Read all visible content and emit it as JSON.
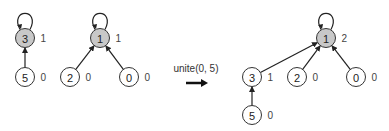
{
  "colors": {
    "root_fill": "#c8c8c8",
    "child_fill": "#ffffff",
    "stroke": "#333333"
  },
  "operation": {
    "label": "unite(0, 5)",
    "arrow_icon": "right-arrow-icon"
  },
  "before": {
    "nodes": [
      {
        "id": "3",
        "rank": "1",
        "root": true
      },
      {
        "id": "5",
        "rank": "0",
        "root": false
      },
      {
        "id": "1",
        "rank": "1",
        "root": true
      },
      {
        "id": "2",
        "rank": "0",
        "root": false
      },
      {
        "id": "0",
        "rank": "0",
        "root": false
      }
    ],
    "edges": [
      {
        "from": "5",
        "to": "3"
      },
      {
        "from": "2",
        "to": "1"
      },
      {
        "from": "0",
        "to": "1"
      }
    ],
    "self_loops": [
      "3",
      "1"
    ]
  },
  "after": {
    "nodes": [
      {
        "id": "1",
        "rank": "2",
        "root": true
      },
      {
        "id": "3",
        "rank": "1",
        "root": false
      },
      {
        "id": "2",
        "rank": "0",
        "root": false
      },
      {
        "id": "0",
        "rank": "0",
        "root": false
      },
      {
        "id": "5",
        "rank": "0",
        "root": false
      }
    ],
    "edges": [
      {
        "from": "3",
        "to": "1"
      },
      {
        "from": "2",
        "to": "1"
      },
      {
        "from": "0",
        "to": "1"
      },
      {
        "from": "5",
        "to": "3"
      }
    ],
    "self_loops": [
      "1"
    ]
  }
}
